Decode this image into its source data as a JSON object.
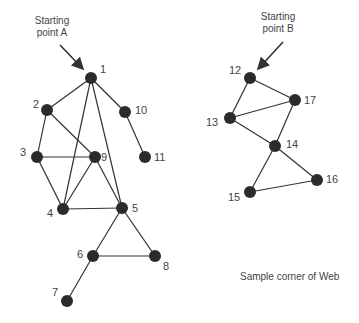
{
  "diagram": {
    "type": "graph",
    "caption": "Sample corner of Web",
    "start_labels": [
      {
        "id": "A",
        "line1": "Starting",
        "line2": "point A",
        "x": 52,
        "y": 24,
        "arrow": [
          60,
          45,
          82,
          68
        ]
      },
      {
        "id": "B",
        "line1": "Starting",
        "line2": "point B",
        "x": 278,
        "y": 20,
        "arrow": [
          283,
          42,
          259,
          68
        ]
      }
    ],
    "nodes": [
      {
        "id": "1",
        "x": 91,
        "y": 78,
        "lx": 100,
        "ly": 73
      },
      {
        "id": "2",
        "x": 47,
        "y": 110,
        "lx": 33,
        "ly": 108
      },
      {
        "id": "3",
        "x": 37,
        "y": 157,
        "lx": 20,
        "ly": 156
      },
      {
        "id": "9",
        "x": 95,
        "y": 157,
        "lx": 101,
        "ly": 161
      },
      {
        "id": "10",
        "x": 125,
        "y": 112,
        "lx": 135,
        "ly": 114
      },
      {
        "id": "11",
        "x": 145,
        "y": 157,
        "lx": 154,
        "ly": 161
      },
      {
        "id": "4",
        "x": 63,
        "y": 209,
        "lx": 47,
        "ly": 217
      },
      {
        "id": "5",
        "x": 122,
        "y": 208,
        "lx": 132,
        "ly": 212
      },
      {
        "id": "6",
        "x": 93,
        "y": 256,
        "lx": 77,
        "ly": 258
      },
      {
        "id": "8",
        "x": 155,
        "y": 256,
        "lx": 163,
        "ly": 270
      },
      {
        "id": "7",
        "x": 67,
        "y": 301,
        "lx": 52,
        "ly": 296
      },
      {
        "id": "12",
        "x": 250,
        "y": 78,
        "lx": 229,
        "ly": 74
      },
      {
        "id": "17",
        "x": 295,
        "y": 100,
        "lx": 304,
        "ly": 104
      },
      {
        "id": "13",
        "x": 230,
        "y": 118,
        "lx": 206,
        "ly": 126
      },
      {
        "id": "14",
        "x": 275,
        "y": 146,
        "lx": 286,
        "ly": 148
      },
      {
        "id": "16",
        "x": 317,
        "y": 180,
        "lx": 326,
        "ly": 183
      },
      {
        "id": "15",
        "x": 250,
        "y": 192,
        "lx": 228,
        "ly": 201
      }
    ],
    "edges": [
      [
        "1",
        "2"
      ],
      [
        "1",
        "4"
      ],
      [
        "1",
        "5"
      ],
      [
        "1",
        "10"
      ],
      [
        "2",
        "3"
      ],
      [
        "2",
        "9"
      ],
      [
        "3",
        "9"
      ],
      [
        "3",
        "4"
      ],
      [
        "9",
        "4"
      ],
      [
        "9",
        "5"
      ],
      [
        "4",
        "5"
      ],
      [
        "5",
        "6"
      ],
      [
        "5",
        "8"
      ],
      [
        "6",
        "8"
      ],
      [
        "6",
        "7"
      ],
      [
        "10",
        "11"
      ],
      [
        "12",
        "13"
      ],
      [
        "12",
        "17"
      ],
      [
        "13",
        "17"
      ],
      [
        "13",
        "14"
      ],
      [
        "17",
        "14"
      ],
      [
        "14",
        "15"
      ],
      [
        "14",
        "16"
      ],
      [
        "15",
        "16"
      ]
    ],
    "caption_pos": {
      "x": 240,
      "y": 280
    }
  }
}
